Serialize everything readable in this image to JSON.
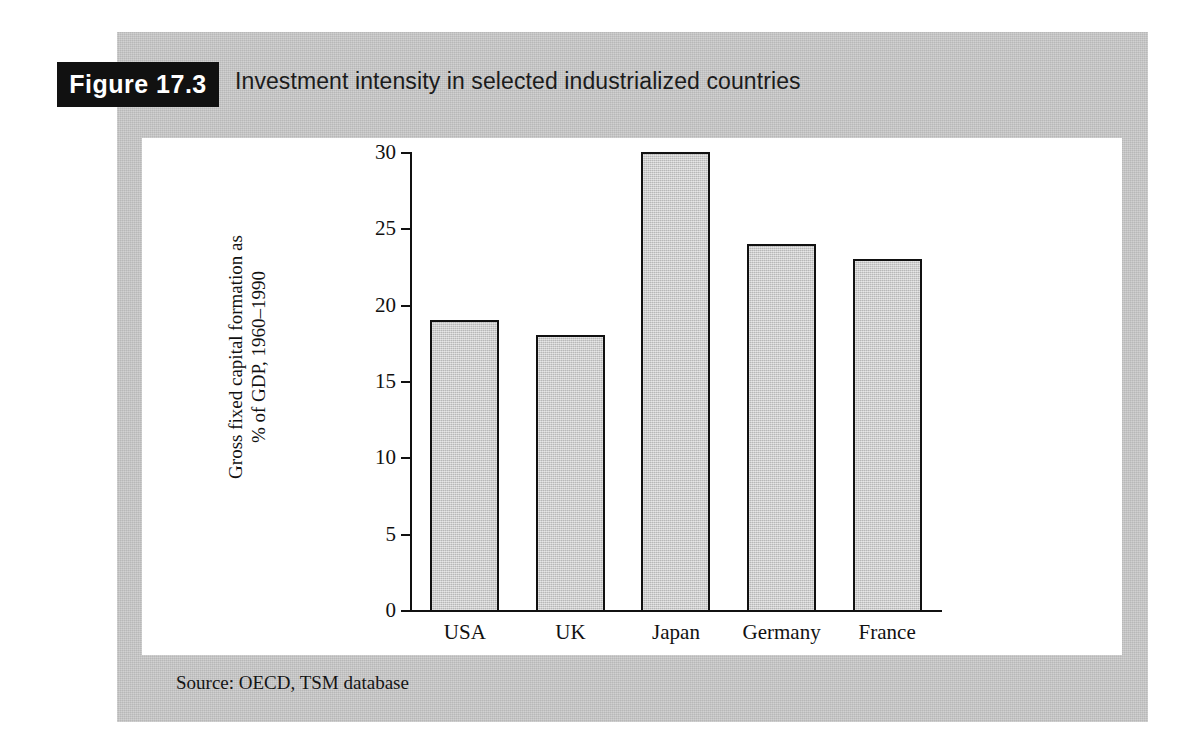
{
  "figure": {
    "badge_label": "Figure 17.3",
    "caption": "Investment intensity in selected industrialized countries",
    "source": "Source: OECD, TSM database"
  },
  "colors": {
    "panel_grey": "#c8c8c8",
    "bar_fill": "#cbcbcb",
    "bar_outline": "#111111",
    "badge_background": "#111111",
    "badge_text": "#ffffff",
    "plot_background": "#ffffff"
  },
  "chart_data": {
    "type": "bar",
    "title": "Investment intensity in selected industrialized countries",
    "categories": [
      "USA",
      "UK",
      "Japan",
      "Germany",
      "France"
    ],
    "values": [
      19,
      18,
      30,
      24,
      23
    ],
    "xlabel": "",
    "ylabel_line1": "Gross fixed capital formation as",
    "ylabel_line2": "% of GDP, 1960–1990",
    "ylim": [
      0,
      30
    ],
    "yticks": [
      0,
      5,
      10,
      15,
      20,
      25,
      30
    ],
    "ytick_labels": [
      "0",
      "5",
      "10",
      "15",
      "20",
      "25",
      "30"
    ],
    "grid": false,
    "legend": false,
    "source": "Source: OECD, TSM database"
  }
}
